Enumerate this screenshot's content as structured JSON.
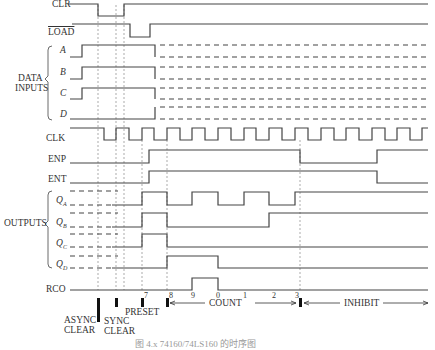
{
  "signals": {
    "clr": "CLR",
    "load": "LOAD",
    "group_data_inputs": [
      "DATA",
      "INPUTS"
    ],
    "a": "A",
    "b": "B",
    "c": "C",
    "d": "D",
    "clk": "CLK",
    "enp": "ENP",
    "ent": "ENT",
    "group_outputs": "OUTPUTS",
    "qa": "Q",
    "qa_sub": "A",
    "qb": "Q",
    "qb_sub": "B",
    "qc": "Q",
    "qc_sub": "C",
    "qd": "Q",
    "qd_sub": "D",
    "rco": "RCO"
  },
  "count_labels": [
    "7",
    "8",
    "9",
    "0",
    "1",
    "2",
    "3"
  ],
  "phases": {
    "async_clear": [
      "ASYNC",
      "CLEAR"
    ],
    "sync_clear": [
      "SYNC",
      "CLEAR"
    ],
    "preset": "PRESET",
    "count": "COUNT",
    "inhibit": "INHIBIT"
  },
  "caption": "图 4.x  74160/74LS160 的时序图"
}
